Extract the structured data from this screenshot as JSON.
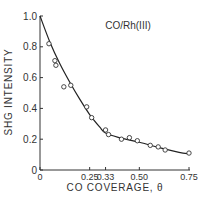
{
  "chart_data": {
    "type": "scatter",
    "title": "CO/Rh(III)",
    "xlabel": "CO COVERAGE, θ",
    "ylabel": "SHG INTENSITY",
    "xlim": [
      0,
      0.75
    ],
    "ylim": [
      0,
      1.0
    ],
    "x_ticks": [
      {
        "value": 0,
        "label": "0"
      },
      {
        "value": 0.25,
        "label": "0.25"
      },
      {
        "value": 0.33,
        "label": "0.33"
      },
      {
        "value": 0.5,
        "label": "0.50"
      },
      {
        "value": 0.75,
        "label": "0.75"
      }
    ],
    "y_ticks": [
      {
        "value": 0,
        "label": "0"
      },
      {
        "value": 0.2,
        "label": "0.2"
      },
      {
        "value": 0.4,
        "label": "0.4"
      },
      {
        "value": 0.6,
        "label": "0.6"
      },
      {
        "value": 0.8,
        "label": "0.8"
      },
      {
        "value": 1.0,
        "label": "1.0"
      }
    ],
    "grid": false,
    "series": [
      {
        "name": "measured",
        "marker": "open-circle",
        "points": [
          [
            0.045,
            0.82
          ],
          [
            0.075,
            0.71
          ],
          [
            0.08,
            0.68
          ],
          [
            0.12,
            0.54
          ],
          [
            0.155,
            0.55
          ],
          [
            0.235,
            0.41
          ],
          [
            0.26,
            0.34
          ],
          [
            0.33,
            0.26
          ],
          [
            0.345,
            0.23
          ],
          [
            0.41,
            0.2
          ],
          [
            0.45,
            0.21
          ],
          [
            0.49,
            0.19
          ],
          [
            0.555,
            0.16
          ],
          [
            0.595,
            0.15
          ],
          [
            0.63,
            0.13
          ],
          [
            0.75,
            0.11
          ]
        ]
      },
      {
        "name": "fit",
        "style": "solid-line",
        "points": [
          [
            0,
            1.0
          ],
          [
            0.05,
            0.83
          ],
          [
            0.1,
            0.69
          ],
          [
            0.15,
            0.57
          ],
          [
            0.2,
            0.46
          ],
          [
            0.25,
            0.36
          ],
          [
            0.3,
            0.28
          ],
          [
            0.33,
            0.24
          ],
          [
            0.4,
            0.21
          ],
          [
            0.5,
            0.18
          ],
          [
            0.6,
            0.145
          ],
          [
            0.7,
            0.115
          ],
          [
            0.75,
            0.105
          ]
        ]
      }
    ]
  }
}
